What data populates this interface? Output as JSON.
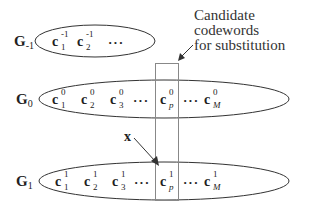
{
  "annotation": {
    "line1": "Candidate codewords",
    "line2": "for substitution"
  },
  "groups": [
    {
      "label": "G",
      "index": "-1",
      "codewords": [
        {
          "base": "c",
          "sup": "-1",
          "sub": "1"
        },
        {
          "base": "c",
          "sup": "-1",
          "sub": "2"
        }
      ],
      "dots": "···"
    },
    {
      "label": "G",
      "index": "0",
      "codewords": [
        {
          "base": "c",
          "sup": "0",
          "sub": "1"
        },
        {
          "base": "c",
          "sup": "0",
          "sub": "2"
        },
        {
          "base": "c",
          "sup": "0",
          "sub": "3"
        },
        {
          "base": "c",
          "sup": "0",
          "sub": "p"
        },
        {
          "base": "c",
          "sup": "0",
          "sub": "M"
        }
      ],
      "dots": "···"
    },
    {
      "label": "G",
      "index": "1",
      "codewords": [
        {
          "base": "c",
          "sup": "1",
          "sub": "1"
        },
        {
          "base": "c",
          "sup": "1",
          "sub": "2"
        },
        {
          "base": "c",
          "sup": "1",
          "sub": "3"
        },
        {
          "base": "c",
          "sup": "1",
          "sub": "p"
        },
        {
          "base": "c",
          "sup": "1",
          "sub": "M"
        }
      ],
      "dots": "···"
    }
  ],
  "input_vector": "x",
  "colors": {
    "stroke": "#333333",
    "text": "#222222",
    "box": "#888888"
  }
}
